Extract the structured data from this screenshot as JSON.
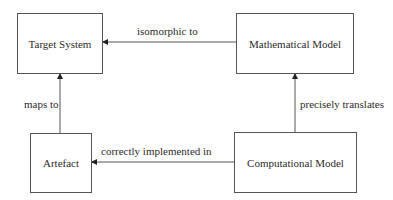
{
  "diagram": {
    "nodes": {
      "target_system": {
        "label": "Target System"
      },
      "mathematical_model": {
        "label": "Mathematical Model"
      },
      "artefact": {
        "label": "Artefact"
      },
      "computational_model": {
        "label": "Computational Model"
      }
    },
    "edges": {
      "isomorphic": {
        "label": "isomorphic to",
        "from": "Mathematical Model",
        "to": "Target System"
      },
      "maps_to": {
        "label": "maps to",
        "from": "Artefact",
        "to": "Target System"
      },
      "precisely_translates": {
        "label": "precisely translates",
        "from": "Computational Model",
        "to": "Mathematical Model"
      },
      "implemented": {
        "label": "correctly implemented in",
        "from": "Computational Model",
        "to": "Artefact"
      }
    },
    "colors": {
      "line": "#555555",
      "text": "#2b2b2b",
      "background": "#ffffff"
    }
  }
}
